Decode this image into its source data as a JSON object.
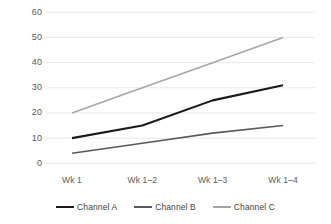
{
  "chart_data": {
    "type": "line",
    "title": "",
    "subtitle": "",
    "xlabel": "",
    "ylabel": "",
    "categories": [
      "Wk 1",
      "Wk 1–2",
      "Wk 1–3",
      "Wk 1–4"
    ],
    "series": [
      {
        "name": "Channel A",
        "values": [
          10,
          15,
          25,
          31
        ],
        "color": "#1a1a1a"
      },
      {
        "name": "Channel B",
        "values": [
          4,
          8,
          12,
          15
        ],
        "color": "#595959"
      },
      {
        "name": "Channel C",
        "values": [
          20,
          30,
          40,
          50
        ],
        "color": "#a6a6a6"
      }
    ],
    "ylim": [
      0,
      60
    ],
    "ytick_values": [
      0,
      10,
      20,
      30,
      40,
      50,
      60
    ],
    "ytick_labels": [
      "0",
      "10",
      "20",
      "30",
      "40",
      "50",
      "60"
    ],
    "grid": {
      "horizontal": true,
      "vertical": false,
      "color": "#e8e8e8"
    },
    "legend": {
      "position": "bottom",
      "entries": [
        "Channel A",
        "Channel B",
        "Channel C"
      ]
    },
    "plot_background": "#ffffff",
    "axis_label_color": "#5a5a5a"
  }
}
